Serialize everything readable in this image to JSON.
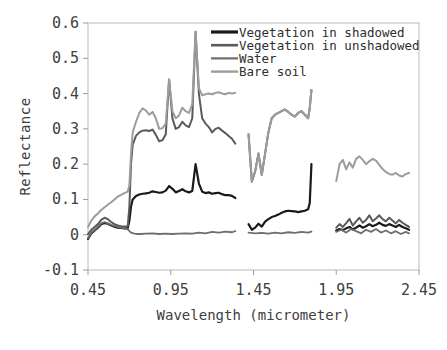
{
  "chart_data": {
    "type": "line",
    "title": "",
    "xlabel": "Wavelength (micrometer)",
    "ylabel": "Reflectance",
    "xlim": [
      0.45,
      2.45
    ],
    "ylim": [
      -0.1,
      0.6
    ],
    "xticks": [
      "0.45",
      "0.95",
      "1.45",
      "1.95",
      "2.45"
    ],
    "xtick_values": [
      0.45,
      0.95,
      1.45,
      1.95,
      2.45
    ],
    "yticks": [
      "0.6",
      "0.5",
      "0.4",
      "0.3",
      "0.2",
      "0.1",
      "0",
      "-0.1"
    ],
    "ytick_values": [
      0.6,
      0.5,
      0.4,
      0.3,
      0.2,
      0.1,
      0.0,
      -0.1
    ],
    "grid": false,
    "legend_position": "top-right",
    "gaps": [
      [
        1.34,
        1.42
      ],
      [
        1.8,
        1.95
      ]
    ],
    "series": [
      {
        "name": "Vegetation in shadowed",
        "color": "#1a1a1a",
        "width": 2.2,
        "x": [
          0.45,
          0.47,
          0.49,
          0.51,
          0.53,
          0.55,
          0.57,
          0.59,
          0.61,
          0.63,
          0.65,
          0.67,
          0.69,
          0.7,
          0.71,
          0.72,
          0.74,
          0.76,
          0.78,
          0.8,
          0.82,
          0.84,
          0.86,
          0.88,
          0.9,
          0.92,
          0.94,
          0.96,
          0.98,
          1.0,
          1.02,
          1.04,
          1.06,
          1.08,
          1.1,
          1.12,
          1.14,
          1.16,
          1.18,
          1.2,
          1.22,
          1.24,
          1.26,
          1.28,
          1.3,
          1.32,
          1.34,
          1.42,
          1.44,
          1.46,
          1.48,
          1.5,
          1.52,
          1.54,
          1.56,
          1.58,
          1.6,
          1.62,
          1.64,
          1.66,
          1.68,
          1.7,
          1.72,
          1.74,
          1.76,
          1.78,
          1.79,
          1.8,
          1.95,
          1.97,
          1.99,
          2.01,
          2.03,
          2.05,
          2.07,
          2.09,
          2.11,
          2.13,
          2.15,
          2.17,
          2.19,
          2.21,
          2.23,
          2.25,
          2.27,
          2.29,
          2.31,
          2.33,
          2.35,
          2.37,
          2.39
        ],
        "y": [
          -0.012,
          0.004,
          0.012,
          0.02,
          0.03,
          0.033,
          0.031,
          0.026,
          0.023,
          0.02,
          0.019,
          0.018,
          0.018,
          0.04,
          0.08,
          0.1,
          0.11,
          0.114,
          0.116,
          0.117,
          0.119,
          0.123,
          0.121,
          0.119,
          0.12,
          0.125,
          0.138,
          0.13,
          0.12,
          0.124,
          0.129,
          0.123,
          0.12,
          0.124,
          0.2,
          0.145,
          0.122,
          0.118,
          0.12,
          0.116,
          0.118,
          0.119,
          0.115,
          0.112,
          0.112,
          0.11,
          0.104,
          0.03,
          0.014,
          0.02,
          0.031,
          0.023,
          0.037,
          0.044,
          0.05,
          0.053,
          0.057,
          0.062,
          0.066,
          0.068,
          0.067,
          0.066,
          0.064,
          0.066,
          0.068,
          0.072,
          0.09,
          0.2,
          0.012,
          0.016,
          0.013,
          0.018,
          0.022,
          0.015,
          0.02,
          0.026,
          0.02,
          0.024,
          0.03,
          0.024,
          0.028,
          0.034,
          0.028,
          0.025,
          0.03,
          0.026,
          0.022,
          0.028,
          0.022,
          0.018,
          0.014
        ]
      },
      {
        "name": "Vegetation in unshadowed",
        "color": "#5a5a5a",
        "width": 2.0,
        "x": [
          0.45,
          0.47,
          0.49,
          0.51,
          0.53,
          0.55,
          0.57,
          0.59,
          0.61,
          0.63,
          0.65,
          0.67,
          0.69,
          0.7,
          0.71,
          0.72,
          0.74,
          0.76,
          0.78,
          0.8,
          0.82,
          0.84,
          0.86,
          0.88,
          0.9,
          0.92,
          0.94,
          0.96,
          0.98,
          1.0,
          1.02,
          1.04,
          1.06,
          1.08,
          1.1,
          1.12,
          1.14,
          1.16,
          1.18,
          1.2,
          1.22,
          1.24,
          1.26,
          1.28,
          1.3,
          1.32,
          1.34,
          1.42,
          1.44,
          1.46,
          1.48,
          1.5,
          1.52,
          1.54,
          1.56,
          1.58,
          1.6,
          1.62,
          1.64,
          1.66,
          1.68,
          1.7,
          1.72,
          1.74,
          1.76,
          1.78,
          1.79,
          1.8,
          1.95,
          1.97,
          1.99,
          2.01,
          2.03,
          2.05,
          2.07,
          2.09,
          2.11,
          2.13,
          2.15,
          2.17,
          2.19,
          2.21,
          2.23,
          2.25,
          2.27,
          2.29,
          2.31,
          2.33,
          2.35,
          2.37,
          2.39
        ],
        "y": [
          0.002,
          0.014,
          0.022,
          0.03,
          0.042,
          0.048,
          0.044,
          0.036,
          0.03,
          0.026,
          0.024,
          0.023,
          0.023,
          0.08,
          0.2,
          0.255,
          0.28,
          0.29,
          0.295,
          0.296,
          0.294,
          0.298,
          0.283,
          0.265,
          0.268,
          0.285,
          0.44,
          0.33,
          0.3,
          0.305,
          0.32,
          0.31,
          0.305,
          0.33,
          0.575,
          0.4,
          0.33,
          0.315,
          0.305,
          0.29,
          0.3,
          0.303,
          0.295,
          0.288,
          0.28,
          0.272,
          0.258,
          0.285,
          0.15,
          0.18,
          0.23,
          0.17,
          0.23,
          0.29,
          0.33,
          0.34,
          0.345,
          0.35,
          0.355,
          0.348,
          0.34,
          0.335,
          0.345,
          0.35,
          0.34,
          0.33,
          0.36,
          0.41,
          0.02,
          0.03,
          0.022,
          0.033,
          0.045,
          0.026,
          0.038,
          0.048,
          0.034,
          0.042,
          0.055,
          0.038,
          0.046,
          0.055,
          0.044,
          0.038,
          0.048,
          0.04,
          0.032,
          0.042,
          0.034,
          0.028,
          0.022
        ]
      },
      {
        "name": "Water",
        "color": "#6e6e6e",
        "width": 1.8,
        "x": [
          0.45,
          0.47,
          0.49,
          0.51,
          0.53,
          0.55,
          0.57,
          0.59,
          0.61,
          0.63,
          0.65,
          0.67,
          0.69,
          0.71,
          0.73,
          0.75,
          0.77,
          0.8,
          0.84,
          0.88,
          0.92,
          0.96,
          1.0,
          1.04,
          1.08,
          1.12,
          1.16,
          1.2,
          1.24,
          1.28,
          1.32,
          1.34,
          1.42,
          1.46,
          1.5,
          1.54,
          1.58,
          1.62,
          1.66,
          1.7,
          1.74,
          1.78,
          1.8,
          1.95,
          1.98,
          2.01,
          2.04,
          2.07,
          2.1,
          2.13,
          2.16,
          2.19,
          2.22,
          2.25,
          2.28,
          2.31,
          2.34,
          2.37,
          2.39
        ],
        "y": [
          -0.01,
          0.006,
          0.014,
          0.022,
          0.032,
          0.036,
          0.032,
          0.028,
          0.025,
          0.022,
          0.02,
          0.018,
          0.015,
          0.006,
          0.003,
          0.002,
          0.002,
          0.003,
          0.004,
          0.002,
          0.003,
          0.002,
          0.003,
          0.004,
          0.003,
          0.006,
          0.004,
          0.008,
          0.006,
          0.009,
          0.007,
          0.01,
          0.006,
          0.004,
          0.005,
          0.003,
          0.006,
          0.004,
          0.007,
          0.005,
          0.008,
          0.006,
          0.009,
          0.008,
          0.014,
          0.006,
          0.016,
          0.01,
          0.004,
          0.014,
          0.008,
          0.016,
          0.006,
          0.012,
          0.004,
          0.01,
          0.002,
          0.008,
          0.004
        ]
      },
      {
        "name": "Bare soil",
        "color": "#9c9c9c",
        "width": 2.0,
        "x": [
          0.45,
          0.47,
          0.49,
          0.51,
          0.53,
          0.55,
          0.57,
          0.59,
          0.61,
          0.63,
          0.65,
          0.67,
          0.69,
          0.7,
          0.71,
          0.72,
          0.74,
          0.76,
          0.78,
          0.8,
          0.82,
          0.84,
          0.86,
          0.88,
          0.9,
          0.92,
          0.94,
          0.96,
          0.98,
          1.0,
          1.02,
          1.04,
          1.06,
          1.08,
          1.1,
          1.12,
          1.14,
          1.16,
          1.18,
          1.2,
          1.22,
          1.24,
          1.26,
          1.28,
          1.3,
          1.32,
          1.34,
          1.42,
          1.44,
          1.46,
          1.48,
          1.5,
          1.52,
          1.54,
          1.56,
          1.58,
          1.6,
          1.62,
          1.64,
          1.66,
          1.68,
          1.7,
          1.72,
          1.74,
          1.76,
          1.78,
          1.79,
          1.8,
          1.95,
          1.97,
          1.99,
          2.01,
          2.03,
          2.05,
          2.07,
          2.09,
          2.11,
          2.13,
          2.15,
          2.17,
          2.19,
          2.21,
          2.23,
          2.25,
          2.27,
          2.29,
          2.31,
          2.33,
          2.35,
          2.37,
          2.39
        ],
        "y": [
          0.022,
          0.04,
          0.052,
          0.06,
          0.07,
          0.078,
          0.085,
          0.092,
          0.1,
          0.108,
          0.113,
          0.118,
          0.122,
          0.14,
          0.23,
          0.29,
          0.32,
          0.345,
          0.358,
          0.352,
          0.34,
          0.348,
          0.33,
          0.3,
          0.302,
          0.315,
          0.44,
          0.35,
          0.33,
          0.338,
          0.36,
          0.35,
          0.345,
          0.37,
          0.575,
          0.415,
          0.395,
          0.398,
          0.4,
          0.398,
          0.402,
          0.404,
          0.4,
          0.398,
          0.402,
          0.4,
          0.402,
          0.285,
          0.15,
          0.18,
          0.23,
          0.17,
          0.23,
          0.29,
          0.33,
          0.34,
          0.345,
          0.35,
          0.355,
          0.348,
          0.34,
          0.335,
          0.345,
          0.35,
          0.34,
          0.33,
          0.36,
          0.41,
          0.152,
          0.2,
          0.212,
          0.185,
          0.205,
          0.19,
          0.215,
          0.222,
          0.212,
          0.2,
          0.208,
          0.215,
          0.21,
          0.198,
          0.186,
          0.178,
          0.172,
          0.17,
          0.175,
          0.168,
          0.165,
          0.172,
          0.175
        ]
      }
    ],
    "legend": [
      {
        "label": "Vegetation in shadowed",
        "color": "#1a1a1a"
      },
      {
        "label": "Vegetation in unshadowed",
        "color": "#5a5a5a"
      },
      {
        "label": "Water",
        "color": "#6e6e6e"
      },
      {
        "label": "Bare soil",
        "color": "#9c9c9c"
      }
    ]
  }
}
